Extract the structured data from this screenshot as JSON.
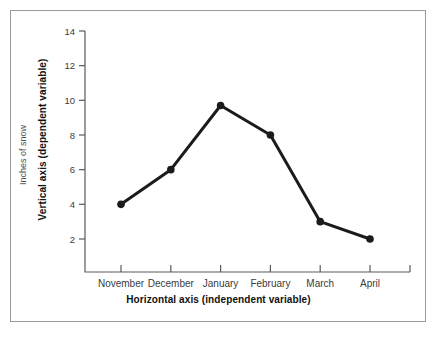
{
  "figure": {
    "border_color": "#9a9a9a",
    "background": "#ffffff"
  },
  "axis_titles": {
    "vertical": "Vertical axis (dependent variable)",
    "horizontal": "Horizontal axis (independent variable)"
  },
  "chart_data": {
    "type": "line",
    "title": "",
    "subtitle": "",
    "xlabel": "Horizontal axis (independent variable)",
    "ylabel": "Inches of snow",
    "categories": [
      "November",
      "December",
      "January",
      "February",
      "March",
      "April"
    ],
    "values": [
      4,
      6,
      9.7,
      8,
      3,
      2
    ],
    "series": [
      {
        "name": "Inches of snow",
        "values": [
          4,
          6,
          9.7,
          8,
          3,
          2
        ],
        "color": "#1b1b1b",
        "marker": "circle"
      }
    ],
    "ylim": [
      0,
      14
    ],
    "yticks": [
      2,
      4,
      6,
      8,
      10,
      12,
      14
    ],
    "ytick_labels": [
      "2",
      "4",
      "6",
      "8",
      "10",
      "12",
      "14"
    ],
    "xtick_labels": [
      "November",
      "December",
      "January",
      "February",
      "March",
      "April"
    ],
    "grid": false,
    "legend": false,
    "legend_position": "none"
  }
}
